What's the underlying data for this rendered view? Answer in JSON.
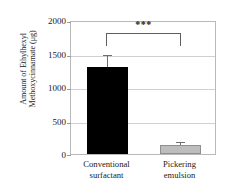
{
  "chart_data": {
    "type": "bar",
    "title": "",
    "xlabel": "",
    "ylabel": "Amount of Ethylhexyl Methoxycinnamate (μg)",
    "ylabel_lines": [
      "Amount of Ethylhexyl",
      "Methoxycinnamate (μg)"
    ],
    "categories": [
      "Conventional surfactant",
      "Pickering emulsion"
    ],
    "category_lines": [
      [
        "Conventional",
        "surfactant"
      ],
      [
        "Pickering",
        "emulsion"
      ]
    ],
    "values": [
      1320,
      140
    ],
    "errors": [
      180,
      40
    ],
    "bar_colors": [
      "#000000",
      "#bdbdbd"
    ],
    "ylim": [
      0,
      2000
    ],
    "yticks": [
      2000,
      1500,
      1000,
      500,
      0
    ],
    "ytick_labels": [
      "2000",
      "1500",
      "1000",
      "500",
      "0"
    ],
    "grid": true,
    "grid_axis": "y",
    "legend": false,
    "annotations": [
      {
        "type": "significance-bracket",
        "label": "***",
        "from_category": "Conventional surfactant",
        "to_category": "Pickering emulsion",
        "y": 1800
      }
    ]
  },
  "axis": {
    "ytick_labels": [
      "2000",
      "1500",
      "1000",
      "500",
      "0"
    ]
  },
  "significance": {
    "stars": "***"
  }
}
